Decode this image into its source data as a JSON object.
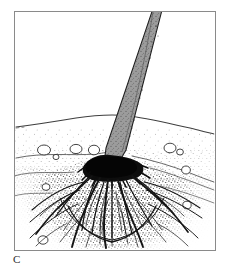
{
  "figure": {
    "panel_label": "C",
    "medium": "pen-and-ink stipple line drawing",
    "background_color": "#ffffff",
    "ink_color": "#1a1a1a",
    "frame": {
      "color": "#8a8a8a",
      "line_width": 1,
      "x": 14,
      "y": 11,
      "width": 201,
      "height": 239
    },
    "soil": {
      "surface_label": "ground surface",
      "surface_color": "#4a4a4a",
      "stipple_color": "#3c3c3c",
      "surface_line_y_left": 126,
      "surface_line_y_crest": 115,
      "surface_line_y_right": 133,
      "strata_lines": 3,
      "pebbles": [
        {
          "cx": 44,
          "cy": 150,
          "rx": 6.5,
          "ry": 5.0
        },
        {
          "cx": 56,
          "cy": 157,
          "rx": 3.0,
          "ry": 2.6
        },
        {
          "cx": 76,
          "cy": 149,
          "rx": 6.0,
          "ry": 4.6
        },
        {
          "cx": 94,
          "cy": 150,
          "rx": 5.6,
          "ry": 4.8
        },
        {
          "cx": 170,
          "cy": 148,
          "rx": 6.0,
          "ry": 4.8
        },
        {
          "cx": 180,
          "cy": 152,
          "rx": 3.4,
          "ry": 3.0
        },
        {
          "cx": 186,
          "cy": 170,
          "rx": 4.4,
          "ry": 4.0
        },
        {
          "cx": 46,
          "cy": 187,
          "rx": 4.0,
          "ry": 3.4
        },
        {
          "cx": 187,
          "cy": 205,
          "rx": 4.2,
          "ry": 3.8
        },
        {
          "cx": 43,
          "cy": 240,
          "rx": 5.0,
          "ry": 4.2
        }
      ]
    },
    "stem": {
      "label": "stem",
      "fill_color": "#9a9a9a",
      "outline_color": "#1f1f1f",
      "top_x": 157,
      "top_y": 11,
      "base_x": 112,
      "base_y": 158,
      "top_width": 9,
      "base_width": 15
    },
    "root_crown": {
      "label": "root crown",
      "color": "#0d0d0d",
      "cx": 112,
      "cy": 166,
      "rx": 27,
      "ry": 13
    },
    "roots": {
      "label": "fibrous root system",
      "color": "#141414",
      "count": 34,
      "spread_left_x": 28,
      "spread_right_x": 200,
      "max_depth_y": 246
    }
  }
}
